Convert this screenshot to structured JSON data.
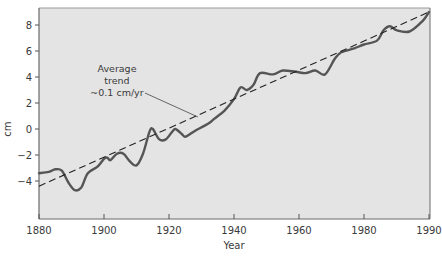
{
  "chart_data": {
    "type": "line",
    "title": "",
    "xlabel": "Year",
    "ylabel": "cm",
    "x_ticks": [
      {
        "label": "1880",
        "px": 39
      },
      {
        "label": "1900",
        "px": 104
      },
      {
        "label": "1920",
        "px": 169
      },
      {
        "label": "1940",
        "px": 234
      },
      {
        "label": "1960",
        "px": 299
      },
      {
        "label": "1980",
        "px": 364
      },
      {
        "label": "1990",
        "px": 429
      }
    ],
    "y_ticks": [
      8,
      6,
      4,
      2,
      0,
      -2,
      -4
    ],
    "ylim": [
      -6.8,
      9.4
    ],
    "grid": false,
    "legend": null,
    "annotation": {
      "lines": [
        "Average",
        "trend",
        "~0.1 cm/yr"
      ]
    },
    "series": [
      {
        "name": "Sea level",
        "style": "solid",
        "color": "#555555",
        "points": [
          [
            1880,
            -3.4
          ],
          [
            1883,
            -3.3
          ],
          [
            1885,
            -3.1
          ],
          [
            1887,
            -3.2
          ],
          [
            1889,
            -4.1
          ],
          [
            1891,
            -4.7
          ],
          [
            1893,
            -4.5
          ],
          [
            1895,
            -3.4
          ],
          [
            1898,
            -2.9
          ],
          [
            1900,
            -2.3
          ],
          [
            1901,
            -2.2
          ],
          [
            1902,
            -2.4
          ],
          [
            1904,
            -1.9
          ],
          [
            1906,
            -1.9
          ],
          [
            1908,
            -2.5
          ],
          [
            1910,
            -2.8
          ],
          [
            1912,
            -1.9
          ],
          [
            1914,
            -0.2
          ],
          [
            1915,
            0.0
          ],
          [
            1917,
            -0.8
          ],
          [
            1919,
            -0.8
          ],
          [
            1921,
            -0.2
          ],
          [
            1922,
            0.0
          ],
          [
            1924,
            -0.4
          ],
          [
            1925,
            -0.6
          ],
          [
            1927,
            -0.3
          ],
          [
            1929,
            0.0
          ],
          [
            1932,
            0.4
          ],
          [
            1934,
            0.8
          ],
          [
            1937,
            1.4
          ],
          [
            1940,
            2.3
          ],
          [
            1942,
            3.2
          ],
          [
            1944,
            3.0
          ],
          [
            1946,
            3.4
          ],
          [
            1948,
            4.3
          ],
          [
            1952,
            4.2
          ],
          [
            1955,
            4.5
          ],
          [
            1959,
            4.4
          ],
          [
            1962,
            4.3
          ],
          [
            1965,
            4.5
          ],
          [
            1968,
            4.2
          ],
          [
            1971,
            5.4
          ],
          [
            1973,
            5.9
          ],
          [
            1977,
            6.2
          ],
          [
            1980,
            6.5
          ],
          [
            1982,
            6.8
          ],
          [
            1983,
            7.6
          ],
          [
            1984,
            7.9
          ],
          [
            1985,
            7.6
          ],
          [
            1987,
            7.5
          ],
          [
            1989,
            8.3
          ],
          [
            1990,
            9.0
          ]
        ]
      },
      {
        "name": "Average trend",
        "style": "dashed",
        "color": "#222222",
        "points": [
          [
            1880,
            -4.4
          ],
          [
            1990,
            9.0
          ]
        ]
      }
    ]
  },
  "figure": {
    "plot_background": "#e4e4e4",
    "frame_color": "#6a6a6a",
    "page_background": "#ffffff"
  }
}
